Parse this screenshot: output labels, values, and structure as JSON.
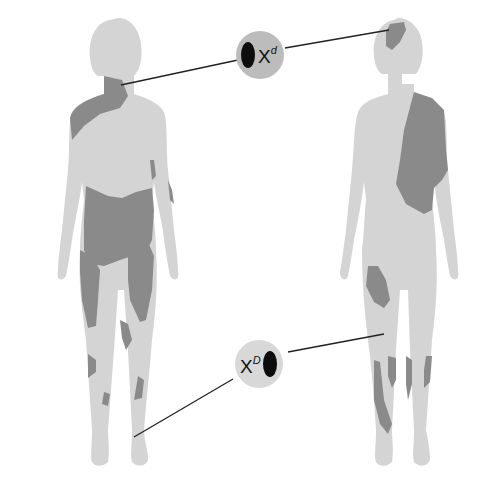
{
  "figure": {
    "type": "x-inactivation-mosaic-diagram",
    "colors": {
      "background": "#ffffff",
      "skin_light": "#d4d4d4",
      "patch_dark": "#8a8a8a",
      "callout_circle": "#bcbcbc",
      "allele_oval": "#0d0d0d",
      "connector_line": "#222222"
    },
    "figures": [
      {
        "name": "left-female-figure",
        "description": "front view, dark patches on neck/shoulder, waist, thighs, shins"
      },
      {
        "name": "right-female-figure",
        "description": "back view, dark patches on head, right shoulder/back, thigh, calves"
      }
    ],
    "callouts": [
      {
        "id": "top",
        "label_base": "X",
        "label_sup": "d",
        "points_to": "left neck and right head"
      },
      {
        "id": "bottom",
        "label_base": "X",
        "label_sup": "D",
        "points_to": "left ankle and right knee"
      }
    ]
  }
}
